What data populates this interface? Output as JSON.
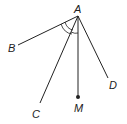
{
  "diagram": {
    "type": "geometry-angle-figure",
    "points": {
      "A": {
        "label": "A",
        "x": 78,
        "y": 16
      },
      "B": {
        "label": "B",
        "x": 18,
        "y": 45
      },
      "C": {
        "label": "C",
        "x": 40,
        "y": 103
      },
      "M": {
        "label": "M",
        "x": 78,
        "y": 97
      },
      "D": {
        "label": "D",
        "x": 108,
        "y": 78
      }
    },
    "segments": [
      "AB",
      "AC",
      "AM",
      "AD"
    ],
    "angle_marks": [
      "angle BAC (double arc)",
      "angle CAM (arc)"
    ],
    "colors": {
      "stroke": "#222222",
      "background": "#ffffff"
    }
  }
}
